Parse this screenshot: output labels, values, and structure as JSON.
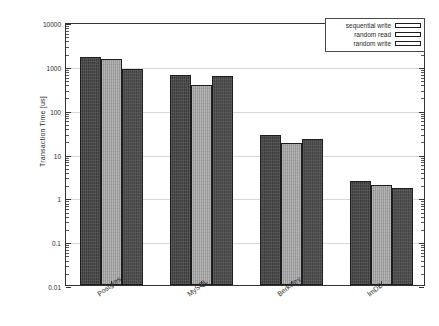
{
  "chart_data": {
    "type": "bar",
    "title": "",
    "xlabel": "",
    "ylabel": "Transaction Time [us]",
    "yscale": "log",
    "ylim": [
      0.01,
      10000
    ],
    "ytick_labels": [
      "10000",
      "1000",
      "100",
      "10",
      "1",
      "0.1",
      "0.01"
    ],
    "ytick_values": [
      10000,
      1000,
      100,
      10,
      1,
      0.1,
      0.01
    ],
    "grid": true,
    "legend_position": "top-right",
    "categories": [
      "Postgres",
      "MySQL",
      "Berkeley",
      "lmDB"
    ],
    "series": [
      {
        "name": "sequential write",
        "color": "#3c3c3c",
        "values": [
          1600,
          630,
          26,
          2.4
        ]
      },
      {
        "name": "random read",
        "color": "#9c9c9c",
        "values": [
          1400,
          370,
          17,
          1.9
        ]
      },
      {
        "name": "random write",
        "color": "#434343",
        "values": [
          830,
          600,
          22,
          1.65
        ]
      }
    ]
  },
  "legend": {
    "items": [
      {
        "label": "sequential write"
      },
      {
        "label": "random read"
      },
      {
        "label": "random write"
      }
    ]
  },
  "axes": {
    "y_title": "Transaction Time [us]",
    "y_ticks": [
      "10000",
      "1000",
      "100",
      "10",
      "1",
      "0.1",
      "0.01"
    ],
    "x_ticks": [
      "Postgres",
      "MySQL",
      "Berkeley",
      "lmDB"
    ]
  }
}
